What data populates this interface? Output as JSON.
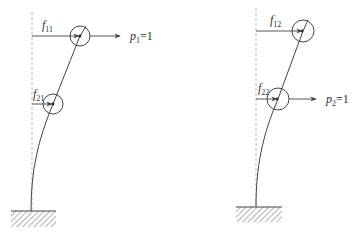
{
  "diagram": {
    "type": "structural-frame-flexibility",
    "colors": {
      "line": "#444444",
      "dashed": "#999999",
      "text": "#333333"
    },
    "left": {
      "top_label": {
        "symbol": "f",
        "sub": "11"
      },
      "bottom_label": {
        "symbol": "f",
        "sub": "21"
      },
      "load_label": {
        "symbol": "p",
        "sub": "1",
        "value": "=1"
      },
      "load_at": "top"
    },
    "right": {
      "top_label": {
        "symbol": "f",
        "sub": "12"
      },
      "bottom_label": {
        "symbol": "f",
        "sub": "22"
      },
      "load_label": {
        "symbol": "p",
        "sub": "2",
        "value": "=1"
      },
      "load_at": "bottom"
    }
  }
}
